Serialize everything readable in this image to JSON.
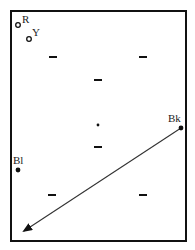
{
  "diagram": {
    "colors": {
      "frame": "#111111",
      "ink": "#222222",
      "background": "#ffffff"
    },
    "points": [
      {
        "id": "R",
        "label": "R",
        "style": "open-circle",
        "x": 18,
        "y": 25
      },
      {
        "id": "Y",
        "label": "Y",
        "style": "open-circle",
        "x": 29,
        "y": 39
      },
      {
        "id": "Bk",
        "label": "Bk",
        "style": "filled-circle",
        "x": 181,
        "y": 128
      },
      {
        "id": "Bl",
        "label": "Bl",
        "style": "filled-circle",
        "x": 18,
        "y": 170
      },
      {
        "id": "center",
        "label": "",
        "style": "small-dot",
        "x": 98,
        "y": 125
      }
    ],
    "dashes": [
      {
        "x": 53,
        "y": 57
      },
      {
        "x": 143,
        "y": 57
      },
      {
        "x": 98,
        "y": 80
      },
      {
        "x": 98,
        "y": 147
      },
      {
        "x": 52,
        "y": 195
      },
      {
        "x": 143,
        "y": 195
      }
    ],
    "arrow": {
      "from": "Bk",
      "x1": 181,
      "y1": 128,
      "x2": 22,
      "y2": 232
    }
  }
}
